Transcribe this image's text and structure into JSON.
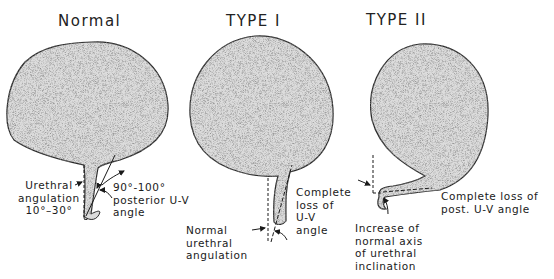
{
  "panels": [
    {
      "title": "Normal",
      "labels": {
        "urethral_angulation": [
          "Urethral",
          "angulation",
          "10°–30°"
        ],
        "posterior_angle": [
          "90°-100°",
          "posterior U-V",
          "angle"
        ]
      }
    },
    {
      "title": "TYPE I",
      "labels": {
        "complete_loss": [
          "Complete",
          "loss of",
          "U-V",
          "angle"
        ],
        "normal_angulation": [
          "Normal",
          "urethral",
          "angulation"
        ]
      }
    },
    {
      "title": "TYPE II",
      "labels": {
        "complete_loss": [
          "Complete loss of",
          "post. U-V angle"
        ],
        "increase_axis": [
          "Increase of",
          "normal axis",
          "of urethral",
          "inclination"
        ]
      }
    }
  ],
  "colors": {
    "fill": "#d9d9d9",
    "outline": "#2a2a2a"
  }
}
